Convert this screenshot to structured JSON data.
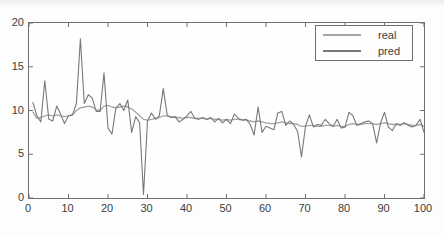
{
  "figure": {
    "background": "#fdfdfd",
    "axes_color": "#6f6f6f",
    "text_color": "#3c3c3c"
  },
  "chart_data": {
    "type": "line",
    "title": "",
    "xlabel": "",
    "ylabel": "",
    "xlim": [
      0,
      100
    ],
    "ylim": [
      0,
      20
    ],
    "xticks": [
      0,
      10,
      20,
      30,
      40,
      50,
      60,
      70,
      80,
      90,
      100
    ],
    "yticks": [
      0,
      5,
      10,
      15,
      20
    ],
    "grid": false,
    "legend_position": "top-right",
    "x_start": 1,
    "x_step": 1,
    "series": [
      {
        "name": "real",
        "color": "#a3a69f",
        "stroke_width": 1.3,
        "values": [
          9.8,
          9.1,
          9.2,
          9.4,
          9.5,
          9.4,
          9.5,
          9.4,
          9.3,
          9.4,
          9.5,
          10.0,
          10.3,
          10.4,
          10.5,
          10.4,
          10.1,
          10.0,
          10.5,
          10.6,
          10.4,
          10.3,
          10.4,
          10.5,
          10.4,
          10.2,
          9.8,
          9.4,
          9.0,
          8.9,
          9.0,
          9.1,
          9.2,
          9.4,
          9.4,
          9.3,
          9.2,
          9.2,
          9.1,
          9.2,
          9.2,
          9.1,
          9.1,
          9.1,
          9.0,
          9.1,
          9.0,
          9.0,
          8.9,
          9.0,
          8.9,
          9.0,
          9.0,
          8.9,
          8.9,
          8.8,
          8.7,
          8.8,
          8.7,
          8.6,
          8.5,
          8.5,
          8.6,
          8.7,
          8.6,
          8.5,
          8.5,
          8.4,
          8.2,
          8.2,
          8.3,
          8.3,
          8.2,
          8.2,
          8.3,
          8.3,
          8.2,
          8.3,
          8.2,
          8.2,
          8.4,
          8.5,
          8.4,
          8.4,
          8.5,
          8.5,
          8.5,
          8.4,
          8.5,
          8.6,
          8.5,
          8.4,
          8.4,
          8.4,
          8.5,
          8.4,
          8.3,
          8.3,
          8.4,
          8.2
        ]
      },
      {
        "name": "pred",
        "color": "#75787c",
        "stroke_width": 1.1,
        "values": [
          10.9,
          9.4,
          8.7,
          13.4,
          9.0,
          8.8,
          10.5,
          9.6,
          8.5,
          9.4,
          9.5,
          10.8,
          18.2,
          10.8,
          11.8,
          11.4,
          9.9,
          9.9,
          14.3,
          8.0,
          7.3,
          10.3,
          10.8,
          10.0,
          11.2,
          7.5,
          9.3,
          8.6,
          0.4,
          8.8,
          9.7,
          9.0,
          9.4,
          12.5,
          9.4,
          9.2,
          9.3,
          8.7,
          9.0,
          9.4,
          9.9,
          9.1,
          9.0,
          9.2,
          9.0,
          9.2,
          8.7,
          9.1,
          8.6,
          9.0,
          8.5,
          9.6,
          9.1,
          8.9,
          9.0,
          8.4,
          7.2,
          10.4,
          7.5,
          8.2,
          8.0,
          7.8,
          9.7,
          9.9,
          8.3,
          8.8,
          8.4,
          7.6,
          4.7,
          8.2,
          9.5,
          8.1,
          8.4,
          8.3,
          9.0,
          8.5,
          8.2,
          9.0,
          8.0,
          8.1,
          9.8,
          9.4,
          8.3,
          8.5,
          8.7,
          8.8,
          8.5,
          6.3,
          8.6,
          9.8,
          8.1,
          7.7,
          8.5,
          8.3,
          8.6,
          8.3,
          8.1,
          8.3,
          9.0,
          7.5
        ]
      }
    ]
  },
  "legend": {
    "real_label": "real",
    "pred_label": "pred"
  },
  "layout": {
    "plot_left": 28,
    "plot_top": 22,
    "plot_width": 395,
    "plot_height": 175,
    "tick_length": 4
  }
}
